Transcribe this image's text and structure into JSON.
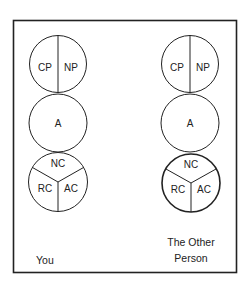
{
  "diagram": {
    "frame": {
      "stroke": "#222222"
    },
    "columns": [
      {
        "id": "you",
        "caption_lines": [
          "You"
        ],
        "parent_circle": {
          "left": "CP",
          "right": "NP"
        },
        "adult_circle": {
          "label": "A"
        },
        "child_circle": {
          "top": "NC",
          "left": "RC",
          "right": "AC"
        }
      },
      {
        "id": "other-person",
        "caption_lines": [
          "The Other",
          "Person"
        ],
        "parent_circle": {
          "left": "CP",
          "right": "NP"
        },
        "adult_circle": {
          "label": "A"
        },
        "child_circle": {
          "top": "NC",
          "left": "RC",
          "right": "AC"
        }
      }
    ]
  }
}
